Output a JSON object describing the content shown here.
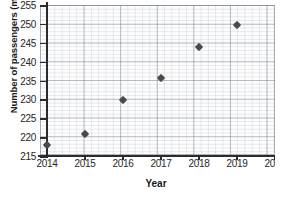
{
  "chart_data": {
    "type": "scatter",
    "title": "",
    "xlabel": "Year",
    "ylabel": "Number of passengers (million)",
    "x": [
      2014,
      2015,
      2016,
      2017,
      2018,
      2019
    ],
    "values": [
      218.0,
      220.7,
      229.8,
      235.7,
      243.8,
      249.8
    ],
    "categories": [
      "2014",
      "2015",
      "2016",
      "2017",
      "2018",
      "2019"
    ],
    "xlim": [
      2014,
      2020
    ],
    "ylim": [
      215,
      255
    ],
    "xticks": [
      "2014",
      "2015",
      "2016",
      "2017",
      "2018",
      "2019",
      "2020"
    ],
    "yticks": [
      "215",
      "220",
      "225",
      "230",
      "235",
      "240",
      "245",
      "250",
      "255"
    ],
    "grid": true,
    "legend": "none",
    "marker_shape": "diamond",
    "marker_color": "#4a4a4a",
    "axis_color": "#2b2b2b",
    "grid_color": "#7b8291"
  }
}
